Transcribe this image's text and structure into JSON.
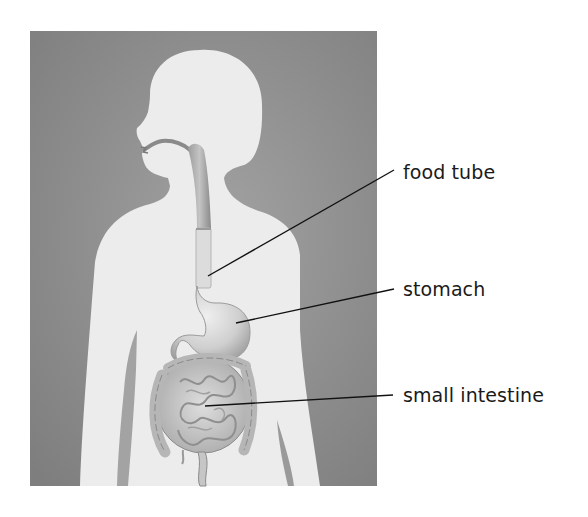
{
  "diagram": {
    "labels": [
      {
        "id": "food-tube",
        "text": "food tube"
      },
      {
        "id": "stomach",
        "text": "stomach"
      },
      {
        "id": "small-intestine",
        "text": "small intestine"
      }
    ]
  },
  "colors": {
    "panel_background": "#8f8f8f",
    "silhouette": "#ececec",
    "organ_fill": "#c8c8c8",
    "organ_shade": "#9a9a9a",
    "leader_line": "#111111",
    "label_text": "#1a1a1a"
  }
}
